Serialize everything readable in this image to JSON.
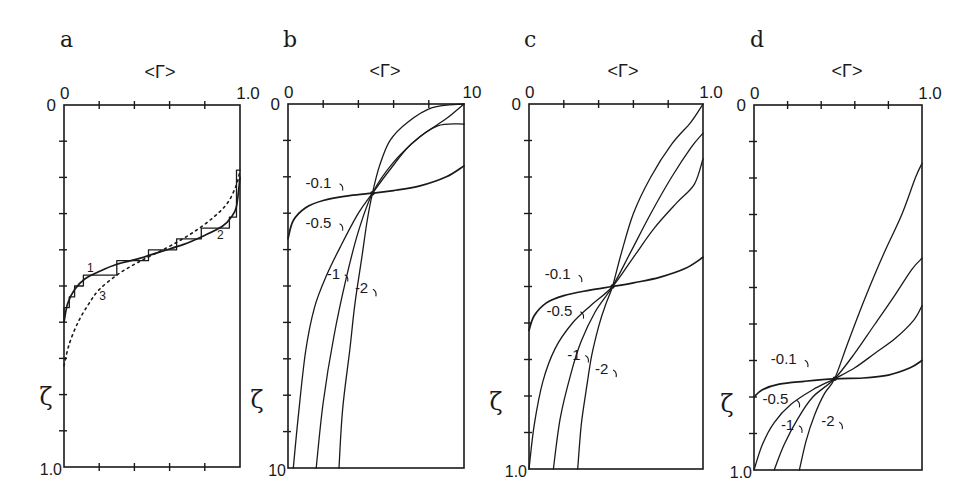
{
  "chart_data": [
    {
      "panel": "a",
      "type": "line",
      "title": "a",
      "xlabel": "<Γ>",
      "ylabel": "ζ",
      "xlim": [
        0,
        1.0
      ],
      "ylim": [
        0,
        1.0
      ],
      "y_inverted": true,
      "x_tick_labels": {
        "left": "0",
        "right": "1.0"
      },
      "y_tick_labels": {
        "top": "0",
        "bottom": "1.0"
      },
      "x_ticks": [
        0,
        0.2,
        0.4,
        0.6,
        0.8,
        1.0
      ],
      "y_ticks": [
        0,
        0.1,
        0.2,
        0.3,
        0.4,
        0.5,
        0.6,
        0.7,
        0.8,
        0.9,
        1.0
      ],
      "bottom_ticks": true,
      "series": [
        {
          "name": "1",
          "style": "step",
          "points": [
            [
              0,
              0.6
            ],
            [
              0,
              0.56
            ],
            [
              0.03,
              0.56
            ],
            [
              0.03,
              0.53
            ],
            [
              0.06,
              0.53
            ],
            [
              0.06,
              0.5
            ],
            [
              0.11,
              0.5
            ],
            [
              0.11,
              0.47
            ],
            [
              0.19,
              0.47
            ],
            [
              0.19,
              0.47
            ],
            [
              0.3,
              0.47
            ],
            [
              0.3,
              0.43
            ],
            [
              0.48,
              0.43
            ],
            [
              0.48,
              0.4
            ],
            [
              0.64,
              0.4
            ],
            [
              0.64,
              0.37
            ],
            [
              0.78,
              0.37
            ],
            [
              0.78,
              0.34
            ],
            [
              0.94,
              0.34
            ],
            [
              0.94,
              0.31
            ],
            [
              0.98,
              0.31
            ],
            [
              0.98,
              0.18
            ],
            [
              1.0,
              0.18
            ]
          ]
        },
        {
          "name": "2",
          "style": "solid",
          "points": [
            [
              0.0,
              0.6
            ],
            [
              0.02,
              0.55
            ],
            [
              0.06,
              0.51
            ],
            [
              0.12,
              0.48
            ],
            [
              0.2,
              0.46
            ],
            [
              0.3,
              0.44
            ],
            [
              0.42,
              0.425
            ],
            [
              0.55,
              0.405
            ],
            [
              0.68,
              0.385
            ],
            [
              0.8,
              0.36
            ],
            [
              0.9,
              0.335
            ],
            [
              0.95,
              0.31
            ],
            [
              0.98,
              0.28
            ],
            [
              1.0,
              0.2
            ]
          ]
        },
        {
          "name": "3",
          "style": "dotted",
          "points": [
            [
              0.0,
              0.72
            ],
            [
              0.03,
              0.66
            ],
            [
              0.08,
              0.6
            ],
            [
              0.14,
              0.55
            ],
            [
              0.2,
              0.51
            ],
            [
              0.3,
              0.47
            ],
            [
              0.4,
              0.44
            ],
            [
              0.5,
              0.415
            ],
            [
              0.62,
              0.385
            ],
            [
              0.74,
              0.35
            ],
            [
              0.85,
              0.31
            ],
            [
              0.93,
              0.27
            ],
            [
              0.98,
              0.22
            ],
            [
              1.0,
              0.18
            ]
          ]
        }
      ],
      "annotations": [
        {
          "text": "1",
          "x": 0.13,
          "y": 0.46
        },
        {
          "text": "2",
          "x": 0.87,
          "y": 0.37
        },
        {
          "text": "3",
          "x": 0.2,
          "y": 0.54
        }
      ]
    },
    {
      "panel": "b",
      "type": "line",
      "title": "b",
      "xlabel": "<Γ>",
      "ylabel": "ζ",
      "xlim": [
        0,
        1.0
      ],
      "ylim": [
        0,
        1.0
      ],
      "y_inverted": true,
      "x_tick_labels": {
        "left": "0",
        "right": "10"
      },
      "y_tick_labels": {
        "top": "0",
        "bottom": "10"
      },
      "x_ticks": [
        0,
        0.2,
        0.4,
        0.6,
        0.8,
        1.0
      ],
      "y_ticks": [
        0,
        0.1,
        0.2,
        0.3,
        0.4,
        0.5,
        0.6,
        0.7,
        0.8,
        0.9,
        1.0
      ],
      "bottom_ticks": false,
      "crossing_point": [
        0.48,
        0.245
      ],
      "series": [
        {
          "name": "-0.1",
          "points": [
            [
              0.0,
              0.37
            ],
            [
              0.03,
              0.32
            ],
            [
              0.1,
              0.285
            ],
            [
              0.2,
              0.265
            ],
            [
              0.35,
              0.252
            ],
            [
              0.48,
              0.245
            ],
            [
              0.6,
              0.238
            ],
            [
              0.75,
              0.225
            ],
            [
              0.9,
              0.2
            ],
            [
              1.0,
              0.17
            ]
          ]
        },
        {
          "name": "-0.5",
          "points": [
            [
              0.03,
              1.0
            ],
            [
              0.06,
              0.85
            ],
            [
              0.1,
              0.68
            ],
            [
              0.15,
              0.56
            ],
            [
              0.22,
              0.47
            ],
            [
              0.3,
              0.39
            ],
            [
              0.4,
              0.3
            ],
            [
              0.48,
              0.245
            ],
            [
              0.58,
              0.18
            ],
            [
              0.7,
              0.11
            ],
            [
              0.85,
              0.06
            ],
            [
              1.0,
              0.055
            ]
          ]
        },
        {
          "name": "-1",
          "points": [
            [
              0.16,
              1.0
            ],
            [
              0.2,
              0.82
            ],
            [
              0.26,
              0.64
            ],
            [
              0.33,
              0.48
            ],
            [
              0.4,
              0.35
            ],
            [
              0.48,
              0.245
            ],
            [
              0.6,
              0.16
            ],
            [
              0.75,
              0.09
            ],
            [
              0.9,
              0.04
            ],
            [
              1.0,
              0.0
            ]
          ]
        },
        {
          "name": "-2",
          "points": [
            [
              0.29,
              1.0
            ],
            [
              0.31,
              0.84
            ],
            [
              0.35,
              0.68
            ],
            [
              0.38,
              0.55
            ],
            [
              0.42,
              0.42
            ],
            [
              0.45,
              0.32
            ],
            [
              0.48,
              0.245
            ],
            [
              0.52,
              0.17
            ],
            [
              0.58,
              0.1
            ],
            [
              0.68,
              0.05
            ],
            [
              0.82,
              0.01
            ],
            [
              1.0,
              0.0
            ]
          ]
        }
      ],
      "annotations": [
        {
          "text": "-0.1",
          "x": 0.1,
          "y": 0.23
        },
        {
          "text": "-0.5",
          "x": 0.1,
          "y": 0.34
        },
        {
          "text": "-1",
          "x": 0.22,
          "y": 0.48
        },
        {
          "text": "-2",
          "x": 0.38,
          "y": 0.52
        }
      ]
    },
    {
      "panel": "c",
      "type": "line",
      "title": "c",
      "xlabel": "<Γ>",
      "ylabel": "ζ",
      "xlim": [
        0,
        1.0
      ],
      "ylim": [
        0,
        1.0
      ],
      "y_inverted": true,
      "x_tick_labels": {
        "left": "0",
        "right": "1.0"
      },
      "y_tick_labels": {
        "top": "0",
        "bottom": "1.0"
      },
      "x_ticks": [
        0,
        0.2,
        0.4,
        0.6,
        0.8,
        1.0
      ],
      "y_ticks": [
        0,
        0.1,
        0.2,
        0.3,
        0.4,
        0.5,
        0.6,
        0.7,
        0.8,
        0.9,
        1.0
      ],
      "bottom_ticks": false,
      "crossing_point": [
        0.48,
        0.5
      ],
      "series": [
        {
          "name": "-0.1",
          "points": [
            [
              0.0,
              0.62
            ],
            [
              0.03,
              0.58
            ],
            [
              0.1,
              0.545
            ],
            [
              0.2,
              0.525
            ],
            [
              0.35,
              0.51
            ],
            [
              0.48,
              0.5
            ],
            [
              0.6,
              0.49
            ],
            [
              0.75,
              0.475
            ],
            [
              0.9,
              0.45
            ],
            [
              1.0,
              0.42
            ]
          ]
        },
        {
          "name": "-0.5",
          "points": [
            [
              0.0,
              1.0
            ],
            [
              0.03,
              0.88
            ],
            [
              0.08,
              0.76
            ],
            [
              0.15,
              0.67
            ],
            [
              0.25,
              0.6
            ],
            [
              0.36,
              0.55
            ],
            [
              0.48,
              0.5
            ],
            [
              0.6,
              0.42
            ],
            [
              0.72,
              0.34
            ],
            [
              0.85,
              0.27
            ],
            [
              0.95,
              0.22
            ],
            [
              1.0,
              0.15
            ]
          ]
        },
        {
          "name": "-1",
          "points": [
            [
              0.14,
              1.0
            ],
            [
              0.18,
              0.86
            ],
            [
              0.24,
              0.74
            ],
            [
              0.3,
              0.65
            ],
            [
              0.38,
              0.57
            ],
            [
              0.48,
              0.5
            ],
            [
              0.58,
              0.41
            ],
            [
              0.7,
              0.3
            ],
            [
              0.82,
              0.2
            ],
            [
              0.93,
              0.12
            ],
            [
              1.0,
              0.08
            ]
          ]
        },
        {
          "name": "-2",
          "points": [
            [
              0.28,
              1.0
            ],
            [
              0.3,
              0.88
            ],
            [
              0.33,
              0.78
            ],
            [
              0.36,
              0.69
            ],
            [
              0.4,
              0.61
            ],
            [
              0.44,
              0.55
            ],
            [
              0.48,
              0.5
            ],
            [
              0.53,
              0.41
            ],
            [
              0.6,
              0.3
            ],
            [
              0.7,
              0.2
            ],
            [
              0.82,
              0.11
            ],
            [
              0.93,
              0.05
            ],
            [
              1.0,
              0.0
            ]
          ]
        }
      ],
      "annotations": [
        {
          "text": "-0.1",
          "x": 0.09,
          "y": 0.48
        },
        {
          "text": "-0.5",
          "x": 0.1,
          "y": 0.58
        },
        {
          "text": "-1",
          "x": 0.22,
          "y": 0.7
        },
        {
          "text": "-2",
          "x": 0.38,
          "y": 0.74
        }
      ]
    },
    {
      "panel": "d",
      "type": "line",
      "title": "d",
      "xlabel": "<Γ>",
      "ylabel": "ζ",
      "xlim": [
        0,
        1.0
      ],
      "ylim": [
        0,
        1.0
      ],
      "y_inverted": true,
      "x_tick_labels": {
        "left": "0",
        "right": "1.0"
      },
      "y_tick_labels": {
        "top": "0",
        "bottom": "1.0"
      },
      "x_ticks": [
        0,
        0.2,
        0.4,
        0.6,
        0.8,
        1.0
      ],
      "y_ticks": [
        0,
        0.1,
        0.2,
        0.3,
        0.4,
        0.5,
        0.6,
        0.7,
        0.8,
        0.9,
        1.0
      ],
      "bottom_ticks": false,
      "crossing_point": [
        0.48,
        0.75
      ],
      "series": [
        {
          "name": "-0.1",
          "points": [
            [
              0.0,
              0.8
            ],
            [
              0.05,
              0.78
            ],
            [
              0.15,
              0.765
            ],
            [
              0.3,
              0.757
            ],
            [
              0.48,
              0.75
            ],
            [
              0.65,
              0.748
            ],
            [
              0.8,
              0.74
            ],
            [
              0.93,
              0.72
            ],
            [
              1.0,
              0.7
            ]
          ]
        },
        {
          "name": "-0.5",
          "points": [
            [
              0.0,
              1.0
            ],
            [
              0.05,
              0.93
            ],
            [
              0.12,
              0.87
            ],
            [
              0.22,
              0.82
            ],
            [
              0.35,
              0.78
            ],
            [
              0.48,
              0.75
            ],
            [
              0.6,
              0.72
            ],
            [
              0.72,
              0.68
            ],
            [
              0.84,
              0.64
            ],
            [
              0.95,
              0.59
            ],
            [
              1.0,
              0.55
            ]
          ]
        },
        {
          "name": "-1",
          "points": [
            [
              0.12,
              1.0
            ],
            [
              0.18,
              0.93
            ],
            [
              0.26,
              0.86
            ],
            [
              0.35,
              0.8
            ],
            [
              0.48,
              0.75
            ],
            [
              0.6,
              0.68
            ],
            [
              0.72,
              0.6
            ],
            [
              0.84,
              0.52
            ],
            [
              0.94,
              0.45
            ],
            [
              1.0,
              0.42
            ]
          ]
        },
        {
          "name": "-2",
          "points": [
            [
              0.27,
              1.0
            ],
            [
              0.31,
              0.92
            ],
            [
              0.36,
              0.85
            ],
            [
              0.42,
              0.79
            ],
            [
              0.48,
              0.75
            ],
            [
              0.56,
              0.65
            ],
            [
              0.66,
              0.53
            ],
            [
              0.77,
              0.41
            ],
            [
              0.88,
              0.3
            ],
            [
              0.96,
              0.2
            ],
            [
              1.0,
              0.16
            ]
          ]
        }
      ],
      "annotations": [
        {
          "text": "-0.1",
          "x": 0.1,
          "y": 0.71
        },
        {
          "text": "-0.5",
          "x": 0.05,
          "y": 0.82
        },
        {
          "text": "-1",
          "x": 0.16,
          "y": 0.89
        },
        {
          "text": "-2",
          "x": 0.4,
          "y": 0.88
        }
      ]
    }
  ],
  "layout": {
    "panels": [
      {
        "id": "a",
        "box": [
          64,
          105,
          240,
          467
        ],
        "title_pos": [
          60,
          47
        ],
        "xlabel_pos": [
          160,
          78
        ],
        "ylabel_pos": [
          46,
          405
        ]
      },
      {
        "id": "b",
        "box": [
          288,
          104,
          464,
          468
        ],
        "title_pos": [
          283,
          47
        ],
        "xlabel_pos": [
          385,
          77
        ],
        "ylabel_pos": [
          257,
          408
        ]
      },
      {
        "id": "c",
        "box": [
          529,
          104,
          703,
          469
        ],
        "title_pos": [
          524,
          47
        ],
        "xlabel_pos": [
          623,
          77
        ],
        "ylabel_pos": [
          496,
          410
        ]
      },
      {
        "id": "d",
        "box": [
          754,
          105,
          922,
          470
        ],
        "title_pos": [
          750,
          47
        ],
        "xlabel_pos": [
          847,
          77
        ],
        "ylabel_pos": [
          727,
          412
        ]
      }
    ]
  }
}
